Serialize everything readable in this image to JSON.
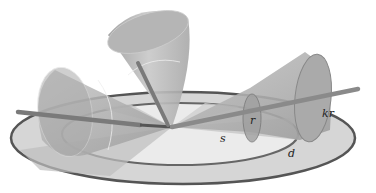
{
  "diagram": {
    "labels": {
      "r": "r",
      "kr": "kr",
      "s": "s",
      "d": "d"
    },
    "colors": {
      "background": "#ffffff",
      "ring_outline": "#555555",
      "ring_fill": "#d4d4d4",
      "inner_disk": "#e8e8e8",
      "cone_fill": "#b8b8b8",
      "cone_dark": "#8f8f8f",
      "rod": "#7a7a7a"
    }
  }
}
